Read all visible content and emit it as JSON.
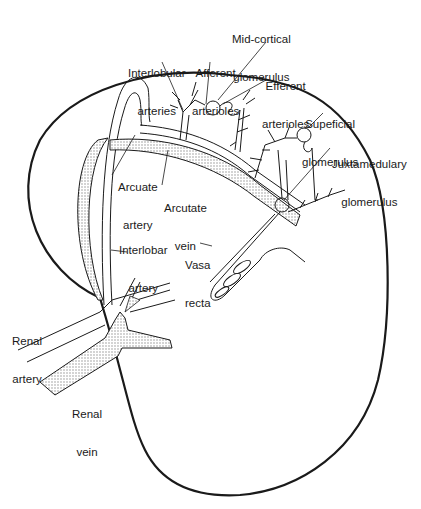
{
  "diagram": {
    "colors": {
      "line": "#1a1a1a",
      "vein_fill": "#d9d9d9",
      "background": "#ffffff"
    },
    "labels": {
      "mid_cortical_glomerulus": [
        "Mid-cortical",
        "glomerulus"
      ],
      "interlobular_arteries": [
        "Interlobular",
        "arteries"
      ],
      "afferent_arterioles": [
        "Afferent",
        "arterioles"
      ],
      "efferent_arterioles": [
        "Efferent",
        "arterioles"
      ],
      "superficial_glomerulus": [
        "Supeficial",
        "glomerulus"
      ],
      "juxtamedullary_glomerulus": [
        "Juxtamedulary",
        "glomerulus"
      ],
      "arcuate_artery": [
        "Arcuate",
        "artery"
      ],
      "arcuate_vein": [
        "Arcutate",
        "vein"
      ],
      "interlobar_artery": [
        "Interlobar",
        "artery"
      ],
      "vasa_recta": [
        "Vasa",
        "recta"
      ],
      "renal_artery": [
        "Renal",
        "artery"
      ],
      "renal_vein": [
        "Renal",
        "vein"
      ]
    }
  }
}
